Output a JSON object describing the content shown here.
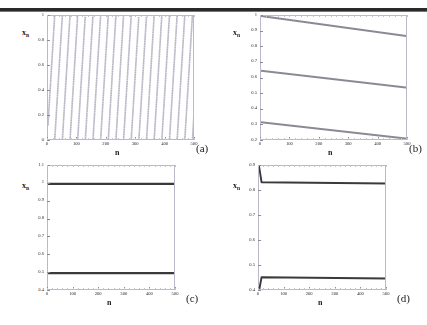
{
  "figure": {
    "panels": [
      {
        "id": "a",
        "label": "(a)",
        "xlabel": "n",
        "ylabel": "x",
        "ylabel_sub": "n",
        "xticks": [
          "0",
          "100",
          "200",
          "300",
          "400",
          "500"
        ],
        "yticks": [
          "0",
          "0.2",
          "0.4",
          "0.6",
          "0.8",
          "1"
        ],
        "xlim": [
          0,
          500
        ],
        "ylim": [
          0,
          1
        ],
        "series_type": "scatter"
      },
      {
        "id": "b",
        "label": "(b)",
        "xlabel": "n",
        "ylabel": "x",
        "ylabel_sub": "n",
        "xticks": [
          "0",
          "100",
          "200",
          "300",
          "400",
          "500"
        ],
        "yticks": [
          "0.2",
          "0.3",
          "0.4",
          "0.5",
          "0.6",
          "0.7",
          "0.8",
          "0.9",
          "1"
        ],
        "xlim": [
          0,
          500
        ],
        "ylim": [
          0.2,
          1
        ],
        "series_type": "line"
      },
      {
        "id": "c",
        "label": "(c)",
        "xlabel": "n",
        "ylabel": "x",
        "ylabel_sub": "n",
        "xticks": [
          "0",
          "100",
          "200",
          "300",
          "400",
          "500"
        ],
        "yticks": [
          "0.4",
          "0.5",
          "0.6",
          "0.7",
          "0.8",
          "0.9",
          "1",
          "1.1"
        ],
        "xlim": [
          0,
          500
        ],
        "ylim": [
          0.4,
          1.1
        ],
        "series_type": "line"
      },
      {
        "id": "d",
        "label": "(d)",
        "xlabel": "n",
        "ylabel": "x",
        "ylabel_sub": "n",
        "xticks": [
          "0",
          "100",
          "200",
          "300",
          "400",
          "500"
        ],
        "yticks": [
          "0.4",
          "0.5",
          "0.6",
          "0.7",
          "0.8",
          "0.9"
        ],
        "xlim": [
          0,
          500
        ],
        "ylim": [
          0.4,
          0.9
        ],
        "series_type": "line"
      }
    ]
  },
  "chart_data": [
    {
      "type": "scatter",
      "panel": "a",
      "title": "",
      "xlabel": "n",
      "ylabel": "x_n",
      "xlim": [
        0,
        500
      ],
      "ylim": [
        0,
        1
      ],
      "grid": false,
      "legend": null,
      "annotation": "(a)",
      "description": "Dense quasi-periodic scatter of x_n values filling the whole unit interval; faint moire striping runs diagonally.",
      "marker_color": "#b9b9c9",
      "n_points_approx": 500
    },
    {
      "type": "line",
      "panel": "b",
      "title": "",
      "xlabel": "n",
      "ylabel": "x_n",
      "xlim": [
        0,
        500
      ],
      "ylim": [
        0.2,
        1
      ],
      "grid": false,
      "legend": null,
      "annotation": "(b)",
      "line_color": "#8a8a96",
      "series": [
        {
          "name": "branch-1",
          "x": [
            0,
            500
          ],
          "values": [
            1.0,
            0.87
          ]
        },
        {
          "name": "branch-2",
          "x": [
            0,
            500
          ],
          "values": [
            0.65,
            0.54
          ]
        },
        {
          "name": "branch-3",
          "x": [
            0,
            500
          ],
          "values": [
            0.32,
            0.215
          ]
        }
      ]
    },
    {
      "type": "line",
      "panel": "c",
      "title": "",
      "xlabel": "n",
      "ylabel": "x_n",
      "xlim": [
        0,
        500
      ],
      "ylim": [
        0.4,
        1.1
      ],
      "grid": false,
      "legend": null,
      "annotation": "(c)",
      "line_color": "#3a3a3a",
      "series": [
        {
          "name": "branch-1",
          "x": [
            0,
            500
          ],
          "values": [
            1.0,
            1.0
          ]
        },
        {
          "name": "branch-2",
          "x": [
            0,
            500
          ],
          "values": [
            0.5,
            0.5
          ]
        }
      ]
    },
    {
      "type": "line",
      "panel": "d",
      "title": "",
      "xlabel": "n",
      "ylabel": "x_n",
      "xlim": [
        0,
        500
      ],
      "ylim": [
        0.4,
        0.9
      ],
      "grid": false,
      "legend": null,
      "annotation": "(d)",
      "line_color": "#3a3a3a",
      "series": [
        {
          "name": "branch-1",
          "x": [
            0,
            10,
            500
          ],
          "values": [
            0.9,
            0.835,
            0.83
          ]
        },
        {
          "name": "branch-2",
          "x": [
            0,
            10,
            500
          ],
          "values": [
            0.4,
            0.455,
            0.45
          ]
        }
      ]
    }
  ],
  "colors": {
    "rule": "#2a2a2a",
    "axis": "#b9b9c9",
    "scatter": "#b9b9c9",
    "line_gray": "#8a8a96",
    "line_dark": "#3a3a3a",
    "text": "#1a1a1a"
  }
}
